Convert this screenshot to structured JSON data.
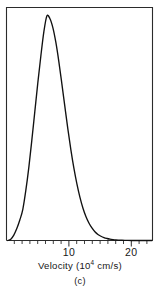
{
  "figure": {
    "caption": "(c)",
    "axis_title_main": "Velocity (10",
    "axis_title_exponent": "4",
    "axis_title_tail": " cm/s)",
    "axis_title_full": "Velocity (10^4 cm/s)",
    "curve_color": "#111111",
    "frame_color": "#2b2b2b",
    "background_color": "#ffffff"
  },
  "chart_data": {
    "type": "line",
    "title": "",
    "subtitle": "",
    "caption": "(c)",
    "xlabel": "Velocity (10^4 cm/s)",
    "ylabel": "",
    "xlim": [
      0,
      24
    ],
    "ylim": [
      0,
      1.0
    ],
    "grid": false,
    "legend": false,
    "xticks": [
      0,
      1,
      2,
      3,
      4,
      5,
      6,
      7,
      8,
      9,
      10,
      11,
      12,
      13,
      14,
      15,
      16,
      17,
      18,
      19,
      20,
      21,
      22,
      23,
      24
    ],
    "xtick_labels": [
      "",
      "",
      "",
      "",
      "",
      "",
      "",
      "",
      "",
      "",
      "10",
      "",
      "",
      "",
      "",
      "",
      "",
      "",
      "",
      "",
      "20",
      "",
      "",
      "",
      ""
    ],
    "yticks": [],
    "ytick_labels": [],
    "distribution": "maxwell-boltzmann-speed",
    "peak_x": 6.5,
    "peak_y": 1.0,
    "series": [
      {
        "name": "Maxwell-Boltzmann speed distribution",
        "color": "#111111",
        "x": [
          0.0,
          0.5,
          1.0,
          1.5,
          2.0,
          2.5,
          3.0,
          3.5,
          4.0,
          4.5,
          5.0,
          5.5,
          6.0,
          6.5,
          7.0,
          7.5,
          8.0,
          8.5,
          9.0,
          9.5,
          10.0,
          10.5,
          11.0,
          11.5,
          12.0,
          12.5,
          13.0,
          13.5,
          14.0,
          14.5,
          15.0,
          15.5,
          16.0,
          16.5,
          17.0,
          17.5,
          18.0,
          18.5,
          19.0,
          19.5,
          20.0,
          21.0,
          22.0,
          23.0,
          24.0
        ],
        "y": [
          0.0,
          0.006,
          0.024,
          0.053,
          0.091,
          0.139,
          0.223,
          0.326,
          0.447,
          0.575,
          0.703,
          0.822,
          0.929,
          1.0,
          0.989,
          0.948,
          0.882,
          0.796,
          0.698,
          0.596,
          0.496,
          0.404,
          0.322,
          0.252,
          0.193,
          0.145,
          0.107,
          0.078,
          0.056,
          0.039,
          0.027,
          0.019,
          0.013,
          0.009,
          0.006,
          0.004,
          0.0025,
          0.0016,
          0.001,
          0.0006,
          0.0004,
          0.0001,
          0.0,
          0.0,
          0.0
        ]
      }
    ]
  }
}
